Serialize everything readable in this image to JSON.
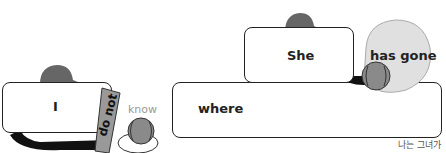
{
  "diagram": {
    "left_group": {
      "subject": "I",
      "bat_label": "do not",
      "verb": "know"
    },
    "right_group": {
      "clause_subject": "She",
      "clause_verb": "has gone",
      "connector": "where"
    },
    "translation": "나는 그녀가"
  },
  "colors": {
    "cap": "#666666",
    "bat": "#999999",
    "glove": "#d9d9d9",
    "ball": "#8a8a8a",
    "border": "#222222",
    "muted_text": "#999999"
  }
}
